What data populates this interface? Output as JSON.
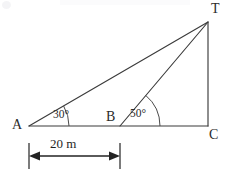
{
  "figure": {
    "kind": "geometry-diagram",
    "width": 228,
    "height": 175,
    "background_color": "#ffffff",
    "line_color": "#3b3b3b",
    "dimension_color": "#232323"
  },
  "vertices": [
    {
      "id": "A",
      "label": "A",
      "x": 29,
      "y": 126,
      "label_x": 12,
      "label_y": 121
    },
    {
      "id": "B",
      "label": "B",
      "x": 120,
      "y": 126,
      "label_x": 106,
      "label_y": 113
    },
    {
      "id": "C",
      "label": "C",
      "x": 208,
      "y": 126,
      "label_x": 209,
      "label_y": 129
    },
    {
      "id": "T",
      "label": "T",
      "x": 208,
      "y": 22,
      "label_x": 211,
      "label_y": 3
    }
  ],
  "segments": [
    {
      "id": "AT",
      "from": "A",
      "to": "T",
      "role": "line-of-sight-from-A"
    },
    {
      "id": "AC",
      "from": "A",
      "to": "C",
      "role": "baseline"
    },
    {
      "id": "BT",
      "from": "B",
      "to": "T",
      "role": "line-of-sight-from-B"
    },
    {
      "id": "TC",
      "from": "T",
      "to": "C",
      "role": "vertical-height"
    }
  ],
  "angles": [
    {
      "id": "angle-A",
      "at": "A",
      "value": 30,
      "label": "30°",
      "arc_radius": 40,
      "label_x": 53,
      "label_y": 109
    },
    {
      "id": "angle-B",
      "at": "B",
      "value": 50,
      "label": "50°",
      "arc_radius": 40,
      "label_x": 130,
      "label_y": 108
    }
  ],
  "dimension": {
    "id": "AB-distance",
    "label": "20 m",
    "value": 20,
    "unit": "m",
    "from": "A",
    "to": "B",
    "x_start": 29,
    "x_end": 120,
    "line_y": 156,
    "tick_top": 143,
    "tick_bottom": 169,
    "label_x": 50,
    "label_y": 138
  }
}
